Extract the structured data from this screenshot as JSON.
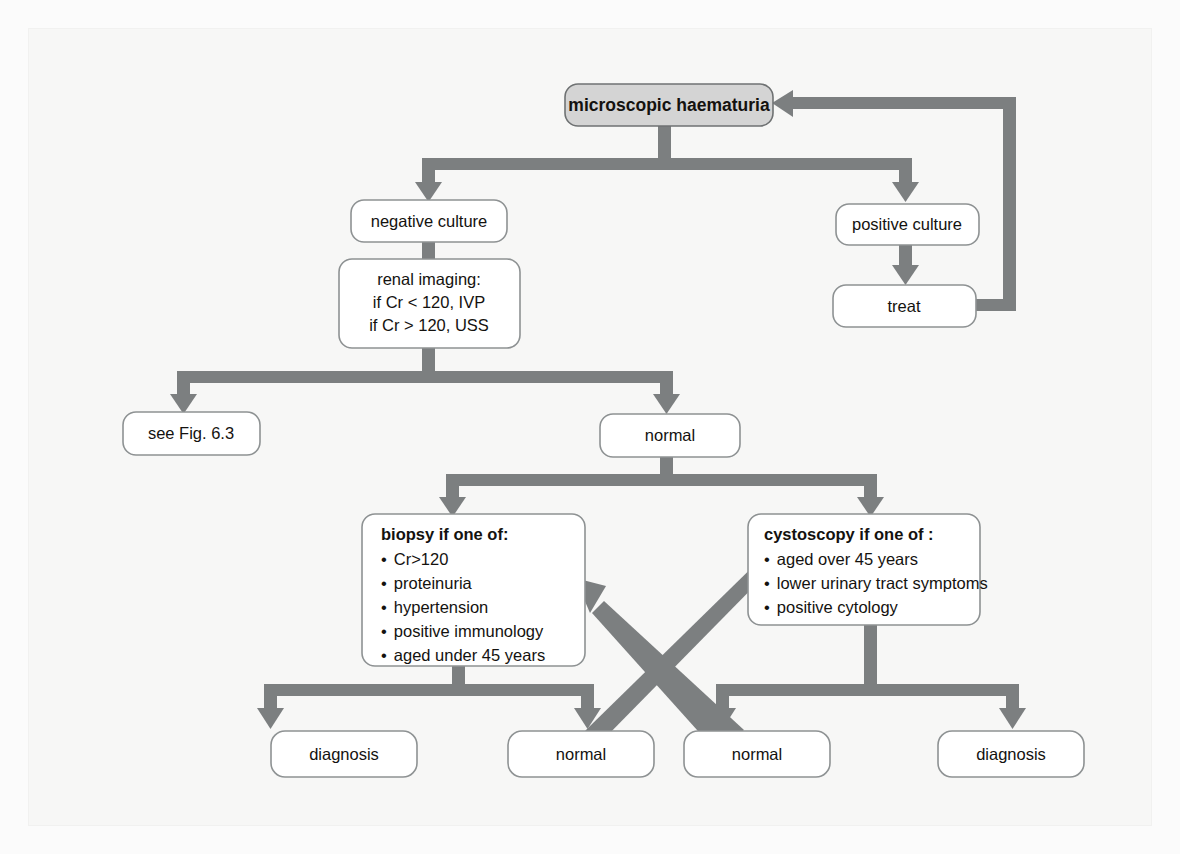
{
  "figure": {
    "type": "flowchart",
    "title_node": "microscopic haematuria",
    "accent_color": "#7c7f80",
    "box_fill": "#ffffff",
    "shaded_box_fill": "#d4d4d4",
    "background_color": "#f7f7f6"
  },
  "nodes": {
    "haematuria": {
      "label": "microscopic haematuria",
      "style": "shaded-bold"
    },
    "negative_culture": {
      "label": "negative culture"
    },
    "positive_culture": {
      "label": "positive culture"
    },
    "treat": {
      "label": "treat"
    },
    "renal_imaging": {
      "lines": [
        "renal imaging:",
        "if Cr < 120, IVP",
        "if Cr > 120, USS"
      ]
    },
    "see_fig": {
      "label": "see Fig. 6.3"
    },
    "normal_imaging": {
      "label": "normal"
    },
    "biopsy": {
      "heading": "biopsy if one of:",
      "bullets": [
        "Cr>120",
        "proteinuria",
        "hypertension",
        "positive immunology",
        "aged under 45 years"
      ]
    },
    "cystoscopy": {
      "heading": "cystoscopy if one of :",
      "bullets": [
        "aged over 45 years",
        "lower urinary tract symptoms",
        "positive cytology"
      ]
    },
    "biopsy_diagnosis": {
      "label": "diagnosis"
    },
    "biopsy_normal": {
      "label": "normal"
    },
    "cystoscopy_normal": {
      "label": "normal"
    },
    "cystoscopy_diagnosis": {
      "label": "diagnosis"
    }
  },
  "bullet_glyph": "•",
  "edges": [
    {
      "from": "haematuria",
      "to": "negative_culture"
    },
    {
      "from": "haematuria",
      "to": "positive_culture"
    },
    {
      "from": "positive_culture",
      "to": "treat"
    },
    {
      "from": "treat",
      "to": "haematuria"
    },
    {
      "from": "negative_culture",
      "to": "renal_imaging"
    },
    {
      "from": "renal_imaging",
      "to": "see_fig"
    },
    {
      "from": "renal_imaging",
      "to": "normal_imaging"
    },
    {
      "from": "normal_imaging",
      "to": "biopsy"
    },
    {
      "from": "normal_imaging",
      "to": "cystoscopy"
    },
    {
      "from": "biopsy",
      "to": "biopsy_diagnosis"
    },
    {
      "from": "biopsy",
      "to": "biopsy_normal"
    },
    {
      "from": "cystoscopy",
      "to": "cystoscopy_normal"
    },
    {
      "from": "cystoscopy",
      "to": "cystoscopy_diagnosis"
    },
    {
      "from": "biopsy_normal",
      "to": "cystoscopy"
    },
    {
      "from": "cystoscopy_normal",
      "to": "biopsy"
    }
  ]
}
